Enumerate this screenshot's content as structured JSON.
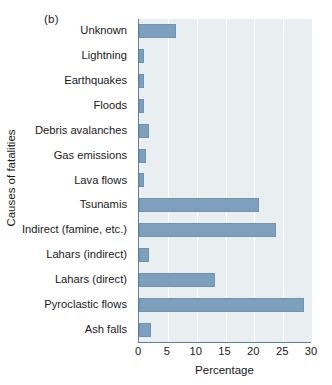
{
  "figure": {
    "panel_label": "(b)",
    "background_color": "#ffffff",
    "plot_background_color": "#e9eef0",
    "bar_color": "#7fa0bd",
    "axis_color": "#5d7f9c",
    "gridline_color": "#ffffff"
  },
  "chart_data": {
    "type": "bar",
    "orientation": "horizontal",
    "title": "(b)",
    "xlabel": "Percentage",
    "ylabel": "Causes of fatalities",
    "xlim": [
      0,
      30
    ],
    "xticks": [
      0,
      5,
      10,
      15,
      20,
      25,
      30
    ],
    "xtick_labels": [
      "0",
      "5",
      "10",
      "15",
      "20",
      "25",
      "30"
    ],
    "grid": "vertical",
    "legend": null,
    "categories": [
      "Unknown",
      "Lightning",
      "Earthquakes",
      "Floods",
      "Debris  avalanches",
      "Gas emissions",
      "Lava flows",
      "Tsunamis",
      "Indirect (famine, etc.)",
      "Lahars (indirect)",
      "Lahars (direct)",
      "Pyroclastic flows",
      "Ash falls"
    ],
    "values": [
      6.4,
      0.8,
      0.8,
      0.8,
      1.8,
      1.3,
      0.8,
      20.8,
      23.7,
      1.8,
      13.2,
      28.6,
      2.1
    ],
    "series": [
      {
        "name": "Percentage of fatalities",
        "values": [
          6.4,
          0.8,
          0.8,
          0.8,
          1.8,
          1.3,
          0.8,
          20.8,
          23.7,
          1.8,
          13.2,
          28.6,
          2.1
        ]
      }
    ]
  }
}
